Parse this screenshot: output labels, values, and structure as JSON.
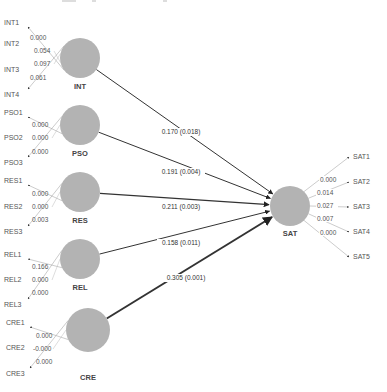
{
  "diagram": {
    "type": "path-model",
    "colors": {
      "node": "#b3b3b3",
      "line": "#333333",
      "text": "#555555"
    },
    "constructs": [
      {
        "id": "INT",
        "label": "INT",
        "cx": 80,
        "cy": 58,
        "r": 20,
        "ly": 89,
        "indicators": [
          {
            "label": "INT1",
            "x": 4,
            "y": 25,
            "value": "0.000",
            "vx": 30,
            "vy": 40
          },
          {
            "label": "INT2",
            "x": 4,
            "y": 46,
            "value": "0.054",
            "vx": 34,
            "vy": 53
          },
          {
            "label": "INT3",
            "x": 4,
            "y": 72,
            "value": "0.097",
            "vx": 34,
            "vy": 66
          },
          {
            "label": "INT4",
            "x": 4,
            "y": 97,
            "value": "0.061",
            "vx": 30,
            "vy": 80
          }
        ]
      },
      {
        "id": "PSO",
        "label": "PSO",
        "cx": 80,
        "cy": 125,
        "r": 20,
        "ly": 156,
        "indicators": [
          {
            "label": "PSO1",
            "x": 4,
            "y": 115,
            "value": "0.000",
            "vx": 32,
            "vy": 127
          },
          {
            "label": "PSO2",
            "x": 4,
            "y": 140,
            "value": "0.000",
            "vx": 32,
            "vy": 140
          },
          {
            "label": "PSO3",
            "x": 4,
            "y": 165,
            "value": "0.000",
            "vx": 32,
            "vy": 154
          }
        ]
      },
      {
        "id": "RES",
        "label": "RES",
        "cx": 80,
        "cy": 192,
        "r": 20,
        "ly": 223,
        "indicators": [
          {
            "label": "RES1",
            "x": 4,
            "y": 183,
            "value": "0.000",
            "vx": 32,
            "vy": 196
          },
          {
            "label": "RES2",
            "x": 4,
            "y": 209,
            "value": "0.000",
            "vx": 32,
            "vy": 209
          },
          {
            "label": "RES3",
            "x": 4,
            "y": 234,
            "value": "0.003",
            "vx": 32,
            "vy": 222
          }
        ]
      },
      {
        "id": "REL",
        "label": "REL",
        "cx": 80,
        "cy": 259,
        "r": 20,
        "ly": 290,
        "indicators": [
          {
            "label": "REL1",
            "x": 4,
            "y": 257,
            "value": "0.166",
            "vx": 32,
            "vy": 269
          },
          {
            "label": "REL2",
            "x": 4,
            "y": 282,
            "value": "0.000",
            "vx": 32,
            "vy": 282
          },
          {
            "label": "REL3",
            "x": 4,
            "y": 307,
            "value": "0.000",
            "vx": 32,
            "vy": 295
          }
        ]
      },
      {
        "id": "CRE",
        "label": "CRE",
        "cx": 88,
        "cy": 330,
        "r": 22,
        "ly": 380,
        "indicators": [
          {
            "label": "CRE1",
            "x": 6,
            "y": 325,
            "value": "0.000",
            "vx": 36,
            "vy": 338
          },
          {
            "label": "CRE2",
            "x": 6,
            "y": 350,
            "value": "-0.000",
            "vx": 33,
            "vy": 351
          },
          {
            "label": "CRE3",
            "x": 6,
            "y": 376,
            "value": "0.000",
            "vx": 36,
            "vy": 364
          }
        ]
      }
    ],
    "target": {
      "id": "SAT",
      "label": "SAT",
      "cx": 290,
      "cy": 206,
      "r": 20,
      "ly": 236,
      "indicators": [
        {
          "label": "SAT1",
          "x": 353,
          "y": 159,
          "value": "0.000",
          "vx": 320,
          "vy": 182
        },
        {
          "label": "SAT2",
          "x": 353,
          "y": 184,
          "value": "0.014",
          "vx": 317,
          "vy": 195
        },
        {
          "label": "SAT3",
          "x": 353,
          "y": 209,
          "value": "0.027",
          "vx": 317,
          "vy": 208
        },
        {
          "label": "SAT4",
          "x": 353,
          "y": 234,
          "value": "0.007",
          "vx": 317,
          "vy": 221
        },
        {
          "label": "SAT5",
          "x": 353,
          "y": 259,
          "value": "0.000",
          "vx": 320,
          "vy": 235
        }
      ]
    },
    "paths": [
      {
        "from": "INT",
        "to": "SAT",
        "label": "0.170 (0.018)",
        "lx": 181,
        "ly": 134,
        "width": 1
      },
      {
        "from": "PSO",
        "to": "SAT",
        "label": "0.191 (0.004)",
        "lx": 181,
        "ly": 174,
        "width": 1
      },
      {
        "from": "RES",
        "to": "SAT",
        "label": "0.211 (0.003)",
        "lx": 181,
        "ly": 209,
        "width": 1.2
      },
      {
        "from": "REL",
        "to": "SAT",
        "label": "0.158 (0.011)",
        "lx": 181,
        "ly": 245,
        "width": 1
      },
      {
        "from": "CRE",
        "to": "SAT",
        "label": "0.305 (0.001)",
        "lx": 186,
        "ly": 280,
        "width": 2
      }
    ]
  }
}
